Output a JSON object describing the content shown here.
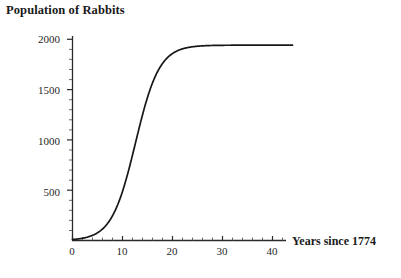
{
  "chart_data": {
    "type": "line",
    "title": "Population of Rabbits",
    "xlabel": "Years since 1774",
    "ylabel": "",
    "grid": false,
    "legend": "none",
    "xlim": [
      0,
      44
    ],
    "ylim": [
      0,
      2060
    ],
    "x_ticks": [
      0,
      10,
      20,
      30,
      40
    ],
    "x_tick_labels": [
      "0",
      "10",
      "20",
      "30",
      "40"
    ],
    "x_minor_tick_step": 2,
    "y_ticks": [
      500,
      1000,
      1500,
      2000
    ],
    "y_tick_labels": [
      "500",
      "1000",
      "1500",
      "2000"
    ],
    "y_minor_tick_step": 100,
    "series": [
      {
        "name": "Population of Rabbits",
        "color": "#171717",
        "model": "logistic",
        "carrying_capacity": 2000,
        "midpoint_year": 12.6,
        "growth_rate": 0.42,
        "x": [
          0,
          1,
          2,
          3,
          4,
          5,
          6,
          7,
          8,
          9,
          10,
          11,
          12,
          13,
          14,
          15,
          16,
          17,
          18,
          19,
          20,
          21,
          22,
          23,
          24,
          25,
          26,
          27,
          28,
          30,
          32,
          34,
          36,
          38,
          40,
          42,
          44
        ],
        "values": [
          10,
          16,
          24,
          36,
          54,
          81,
          120,
          177,
          258,
          369,
          518,
          708,
          934,
          1184,
          1435,
          1661,
          1843,
          1975,
          2062,
          2114,
          2142,
          2156,
          2162,
          2165,
          2166,
          2167,
          2167,
          2167,
          2167,
          2167,
          2167,
          2167,
          2167,
          2167,
          2167,
          2167,
          2167
        ]
      }
    ]
  },
  "axis": {
    "x_tick_values": [
      "0",
      "10",
      "20",
      "30",
      "40"
    ],
    "y_tick_values": [
      "500",
      "1000",
      "1500",
      "2000"
    ]
  },
  "colors": {
    "curve": "#171717",
    "axis": "#2b2b2b",
    "background": "#ffffff",
    "text": "#1a1a1a"
  }
}
